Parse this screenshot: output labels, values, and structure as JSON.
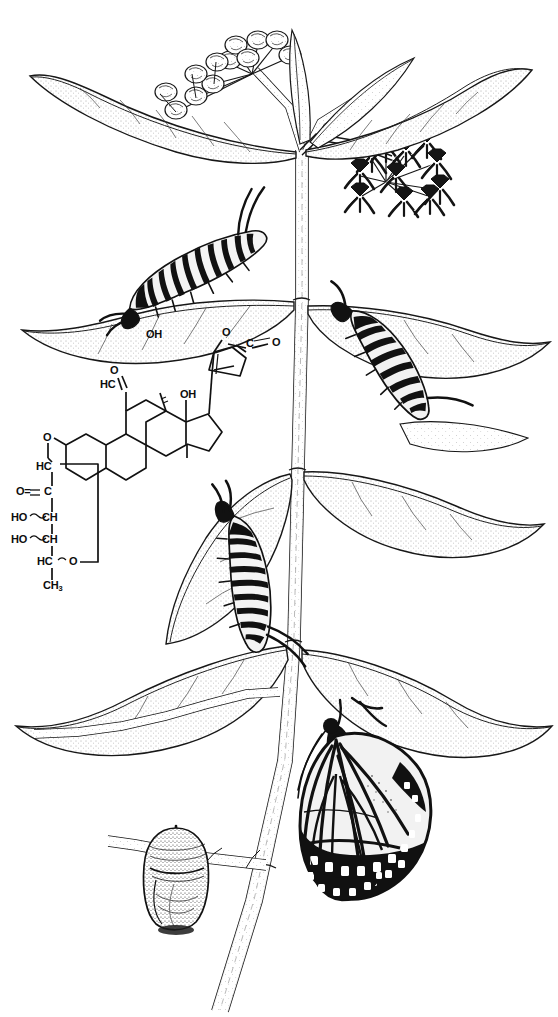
{
  "plate": {
    "title": "Monarch butterfly life cycle on milkweed with cardenolide structure",
    "medium": "pen-and-ink stipple line drawing",
    "background_color": "#ffffff",
    "ink_color": "#111111",
    "width": 558,
    "height": 1017
  },
  "chemistry": {
    "name": "cardenolide-glycoside-structure",
    "description": "Cardiac glycoside: steroid nucleus with butenolide lactone and deoxysugar",
    "labels": [
      {
        "id": "oh-c11",
        "text": "OH",
        "x": 146,
        "y": 334,
        "size": 11
      },
      {
        "id": "o-aldehyde",
        "text": "O",
        "x": 110,
        "y": 370,
        "size": 11
      },
      {
        "id": "hc-aldehyde",
        "text": "HC",
        "x": 100,
        "y": 384,
        "size": 11
      },
      {
        "id": "oh-c14",
        "text": "OH",
        "x": 182,
        "y": 393,
        "size": 11
      },
      {
        "id": "o-lactone",
        "text": "O",
        "x": 224,
        "y": 332,
        "size": 11
      },
      {
        "id": "c-lactone",
        "text": "C",
        "x": 249,
        "y": 343,
        "size": 11
      },
      {
        "id": "o-lactone-carbonyl",
        "text": "O",
        "x": 276,
        "y": 342,
        "size": 11
      },
      {
        "id": "o-glycosidic",
        "text": "O",
        "x": 44,
        "y": 437,
        "size": 11
      },
      {
        "id": "hc-sugar-1",
        "text": "HC",
        "x": 36,
        "y": 466,
        "size": 11
      },
      {
        "id": "o-sugar-keto",
        "text": "O=",
        "x": 18,
        "y": 492,
        "size": 11
      },
      {
        "id": "c-sugar-keto",
        "text": "C",
        "x": 44,
        "y": 492,
        "size": 11
      },
      {
        "id": "ho-sugar-1",
        "text": "HO",
        "x": 14,
        "y": 518,
        "size": 11
      },
      {
        "id": "ch-sugar-1",
        "text": "CH",
        "x": 42,
        "y": 518,
        "size": 11
      },
      {
        "id": "ho-sugar-2",
        "text": "HO",
        "x": 14,
        "y": 540,
        "size": 11
      },
      {
        "id": "ch-sugar-2",
        "text": "CH",
        "x": 42,
        "y": 540,
        "size": 11
      },
      {
        "id": "hc-sugar-2",
        "text": "HC",
        "x": 38,
        "y": 562,
        "size": 11
      },
      {
        "id": "o-ring",
        "text": "O",
        "x": 70,
        "y": 562,
        "size": 11
      },
      {
        "id": "ch3-sugar",
        "text": "CH",
        "x": 44,
        "y": 586,
        "size": 11,
        "sub": "3"
      }
    ]
  },
  "life_stages": [
    {
      "id": "larva-upper-left",
      "label": "caterpillar (larva) on upper leaf"
    },
    {
      "id": "larva-upper-right",
      "label": "caterpillar (larva) on right leaf"
    },
    {
      "id": "larva-middle",
      "label": "caterpillar (larva) on mid leaf"
    },
    {
      "id": "chrysalis",
      "label": "chrysalis (pupa) on branch"
    },
    {
      "id": "adult-butterfly",
      "label": "adult monarch butterfly, wings closed"
    }
  ],
  "plant": {
    "common_name": "milkweed",
    "parts": [
      {
        "id": "main-stem",
        "label": "main vertical stem"
      },
      {
        "id": "flower-umbel-left",
        "label": "milkweed flower-bud umbel, left"
      },
      {
        "id": "flower-umbel-right",
        "label": "open milkweed flower umbel, right"
      },
      {
        "id": "leaves",
        "label": "opposite lanceolate leaves"
      }
    ]
  }
}
